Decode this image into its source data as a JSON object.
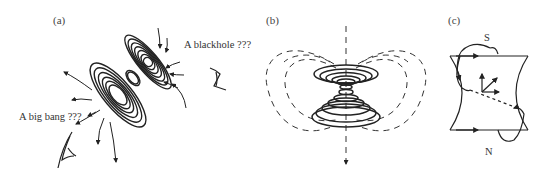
{
  "figure": {
    "panels": [
      {
        "id": "a",
        "label": "(a)",
        "annotations": {
          "blackhole": "A blackhole ???",
          "big_bang": "A big bang ???"
        },
        "icons": [
          "eye-icon-upper",
          "eye-icon-lower"
        ]
      },
      {
        "id": "b",
        "label": "(b)"
      },
      {
        "id": "c",
        "label": "(c)",
        "poles": {
          "top": "S",
          "bottom": "N"
        }
      }
    ]
  }
}
